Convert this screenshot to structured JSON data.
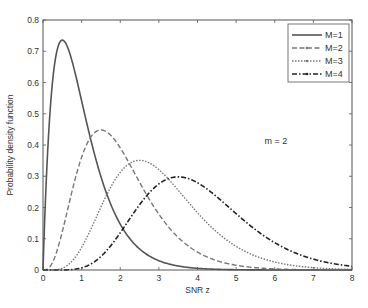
{
  "chart_data": {
    "type": "line",
    "title": "",
    "xlabel": "SNR z",
    "ylabel": "Probability density function",
    "xlim": [
      0,
      8
    ],
    "ylim": [
      0,
      0.8
    ],
    "xticks": [
      0,
      1,
      2,
      3,
      4,
      5,
      6,
      7,
      8
    ],
    "yticks": [
      0,
      0.1,
      0.2,
      0.3,
      0.4,
      0.5,
      0.6,
      0.7,
      0.8
    ],
    "xtick_labels": [
      "0",
      "1",
      "2",
      "3",
      "4",
      "5",
      "6",
      "7",
      "8"
    ],
    "ytick_labels": [
      "0",
      "0.1",
      "0.2",
      "0.3",
      "0.4",
      "0.5",
      "0.6",
      "0.7",
      "0.8"
    ],
    "grid": false,
    "legend_position": "upper right",
    "annotations": [
      {
        "text": "m = 2",
        "x": 4.5,
        "y": 0.58
      }
    ],
    "x": [
      0,
      0.25,
      0.5,
      0.75,
      1,
      1.5,
      2,
      2.5,
      3,
      3.5,
      4,
      4.5,
      5,
      5.5,
      6,
      6.5,
      7,
      7.5,
      8
    ],
    "series": [
      {
        "name": "M=1",
        "style": "solid",
        "color": "#555555",
        "peak": {
          "x": 0.5,
          "y": 0.736
        },
        "values": [
          0,
          0.607,
          0.736,
          0.669,
          0.541,
          0.299,
          0.147,
          0.067,
          0.03,
          0.013,
          0.005,
          0.002,
          0.001,
          0.0,
          0.0,
          0.0,
          0.0,
          0.0,
          0.0
        ]
      },
      {
        "name": "M=2",
        "style": "dashed",
        "color": "#777777",
        "peak": {
          "x": 1.5,
          "y": 0.448
        },
        "values": [
          0,
          0.025,
          0.123,
          0.251,
          0.361,
          0.448,
          0.391,
          0.281,
          0.178,
          0.104,
          0.057,
          0.03,
          0.015,
          0.007,
          0.003,
          0.002,
          0.001,
          0.0,
          0.0
        ]
      },
      {
        "name": "M=3",
        "style": "dotted",
        "color": "#777777",
        "peak": {
          "x": 2.5,
          "y": 0.351
        },
        "values": [
          0,
          0.001,
          0.015,
          0.063,
          0.144,
          0.302,
          0.347,
          0.351,
          0.268,
          0.188,
          0.12,
          0.072,
          0.041,
          0.022,
          0.012,
          0.006,
          0.003,
          0.001,
          0.001
        ]
      },
      {
        "name": "M=4",
        "style": "dashdot",
        "color": "#222222",
        "peak": {
          "x": 3.5,
          "y": 0.298
        },
        "values": [
          0,
          0.0,
          0.001,
          0.01,
          0.041,
          0.149,
          0.223,
          0.279,
          0.29,
          0.298,
          0.246,
          0.183,
          0.13,
          0.087,
          0.055,
          0.034,
          0.02,
          0.011,
          0.006
        ]
      }
    ]
  }
}
